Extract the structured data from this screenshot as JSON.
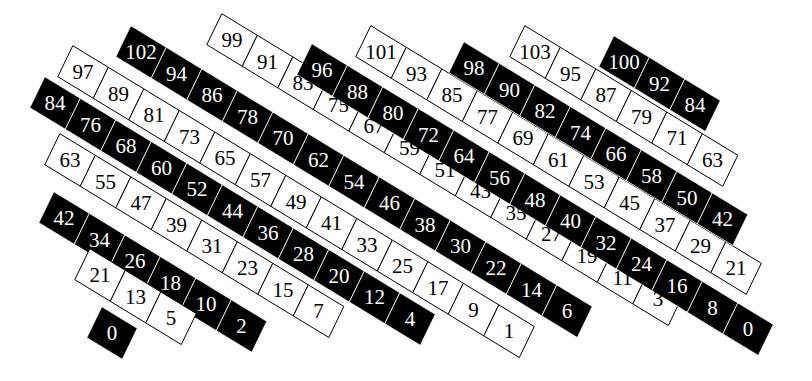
{
  "diagram": {
    "title": "",
    "colors": {
      "black": "#000000",
      "white": "#ffffff",
      "outline": "#000000"
    },
    "step": {
      "dx": 35.5,
      "dy": 21.6
    },
    "cross": {
      "dx": -15,
      "dy": 31
    },
    "bands": [
      {
        "color": "white",
        "start": [
          83,
          72
        ],
        "values": [
          97,
          89,
          81,
          73,
          65,
          57,
          49,
          41,
          33,
          25,
          17,
          9,
          1
        ]
      },
      {
        "color": "black",
        "start": [
          55,
          103
        ],
        "values": [
          84,
          76,
          68,
          60,
          52,
          44,
          36,
          28,
          20,
          12,
          4
        ]
      },
      {
        "color": "white",
        "start": [
          70,
          160
        ],
        "values": [
          63,
          55,
          47,
          39,
          31,
          23,
          15,
          7
        ]
      },
      {
        "color": "black",
        "start": [
          64,
          218
        ],
        "values": [
          42,
          34,
          26,
          18,
          10,
          2
        ]
      },
      {
        "color": "white",
        "start": [
          100,
          275
        ],
        "values": [
          21,
          13,
          5
        ]
      },
      {
        "color": "black",
        "start": [
          112,
          333
        ],
        "values": [
          0
        ]
      },
      {
        "color": "black",
        "start": [
          141,
          52
        ],
        "values": [
          102,
          94,
          86,
          78,
          70,
          62,
          54,
          46,
          38,
          30,
          22,
          14,
          6
        ]
      },
      {
        "color": "white",
        "start": [
          232,
          40
        ],
        "values": [
          99,
          91,
          83,
          75,
          67,
          59,
          51,
          43,
          35,
          27,
          19,
          11,
          3
        ]
      },
      {
        "color": "black",
        "start": [
          322,
          70
        ],
        "values": [
          96,
          88,
          80,
          72,
          64,
          56,
          48,
          40,
          32,
          24,
          16,
          8,
          0
        ]
      },
      {
        "color": "white",
        "start": [
          381,
          52
        ],
        "values": [
          101,
          93,
          85,
          77,
          69,
          61,
          53,
          45,
          37,
          29,
          21
        ]
      },
      {
        "color": "black",
        "start": [
          474,
          68
        ],
        "values": [
          98,
          90,
          82,
          74,
          66,
          58,
          50,
          42
        ]
      },
      {
        "color": "white",
        "start": [
          535,
          52
        ],
        "values": [
          103,
          95,
          87,
          79,
          71,
          63
        ]
      },
      {
        "color": "black",
        "start": [
          624,
          62
        ],
        "values": [
          100,
          92,
          84
        ]
      }
    ]
  }
}
